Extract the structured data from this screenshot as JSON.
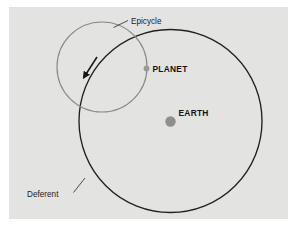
{
  "figure": {
    "panel_background": "#e3e3e2",
    "page_background": "#ffffff"
  },
  "labels": {
    "epicycle": "Epicycle",
    "deferent": "Deferent",
    "planet": "PLANET",
    "earth": "EARTH"
  },
  "colors": {
    "deferent_stroke": "#23211f",
    "epicycle_stroke": "#8c8b88",
    "earth_dot": "#908f8d",
    "planet_dot": "#9a9997",
    "leader_line": "#3a3a38",
    "arrow": "#16150f",
    "text": "#1d1d1d"
  },
  "geometry": {
    "deferent": {
      "cx": 170.5,
      "cy": 121,
      "r": 91.5,
      "stroke_width": 1.35
    },
    "epicycle": {
      "cx": 102,
      "cy": 67,
      "r": 45,
      "stroke_width": 1.2
    },
    "earth_dot": {
      "cx": 170.5,
      "cy": 121.5,
      "r": 5.2
    },
    "planet_dot": {
      "cx": 146.5,
      "cy": 68.5,
      "r": 2.9
    },
    "motion_arrow": {
      "from_x": 97,
      "from_y": 57,
      "to_x": 83.5,
      "to_y": 78
    },
    "epicycle_leader": {
      "from_x": 128,
      "from_y": 20.5,
      "to_x": 113.5,
      "to_y": 27.5
    },
    "deferent_leader": {
      "from_x": 73.5,
      "from_y": 192.5,
      "to_x": 85,
      "to_y": 178
    }
  },
  "label_positions": {
    "epicycle": {
      "x": 131,
      "y": 23.5
    },
    "deferent": {
      "x": 27,
      "y": 196.5
    },
    "planet": {
      "x": 152.5,
      "y": 71.5
    },
    "earth": {
      "x": 178.5,
      "y": 115.5
    }
  }
}
